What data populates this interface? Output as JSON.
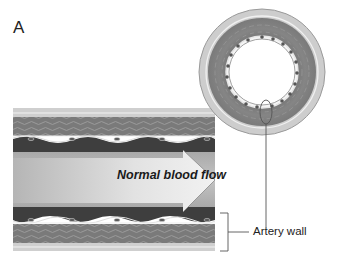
{
  "figure": {
    "panel_label": "A",
    "labels": {
      "flow": "Normal blood flow",
      "wall": "Artery wall"
    },
    "colors": {
      "adventitia": "#c9c9c9",
      "media": "#7d7d7d",
      "intima_dark": "#3f3f3f",
      "lumen": "#b0b0b0",
      "arrow_light": "#e6e6e6",
      "arrow_dark": "#9a9a9a",
      "line": "#555555"
    }
  }
}
